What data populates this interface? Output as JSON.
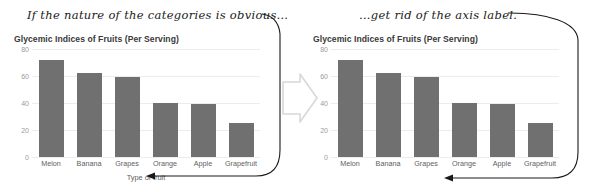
{
  "panels": [
    {
      "id": "before",
      "annotation": "If the nature of the categories is obvious…",
      "chart_title": "Glycemic Indices of Fruits (Per Serving)",
      "axis_title": "Type of fruit",
      "show_axis_title": true
    },
    {
      "id": "after",
      "annotation": "…get rid of the axis label.",
      "chart_title": "Glycemic Indices of Fruits (Per Serving)",
      "axis_title": "",
      "show_axis_title": false
    }
  ],
  "yticks": [
    "80",
    "60",
    "40",
    "20",
    "0"
  ],
  "categories": [
    "Melon",
    "Banana",
    "Grapes",
    "Orange",
    "Apple",
    "Grapefruit"
  ],
  "colors": {
    "bar": "#707070",
    "gridline": "#ececec",
    "tick_text": "#9b9b9b",
    "label_text": "#5e5e5e",
    "title_text": "#3a3a3a",
    "annotation_text": "#1a1a1a",
    "transition_arrow": "#d8d8d8",
    "background": "#ffffff"
  },
  "transition_arrow": "hollow-right-arrow",
  "chart_data": {
    "type": "bar",
    "title": "Glycemic Indices of Fruits (Per Serving)",
    "xlabel": "Type of fruit",
    "ylabel": "",
    "categories": [
      "Melon",
      "Banana",
      "Grapes",
      "Orange",
      "Apple",
      "Grapefruit"
    ],
    "values": [
      72,
      62,
      59,
      40,
      39,
      25
    ],
    "ylim": [
      0,
      80
    ],
    "yticks": [
      0,
      20,
      40,
      60,
      80
    ],
    "grid": true,
    "legend": false
  }
}
